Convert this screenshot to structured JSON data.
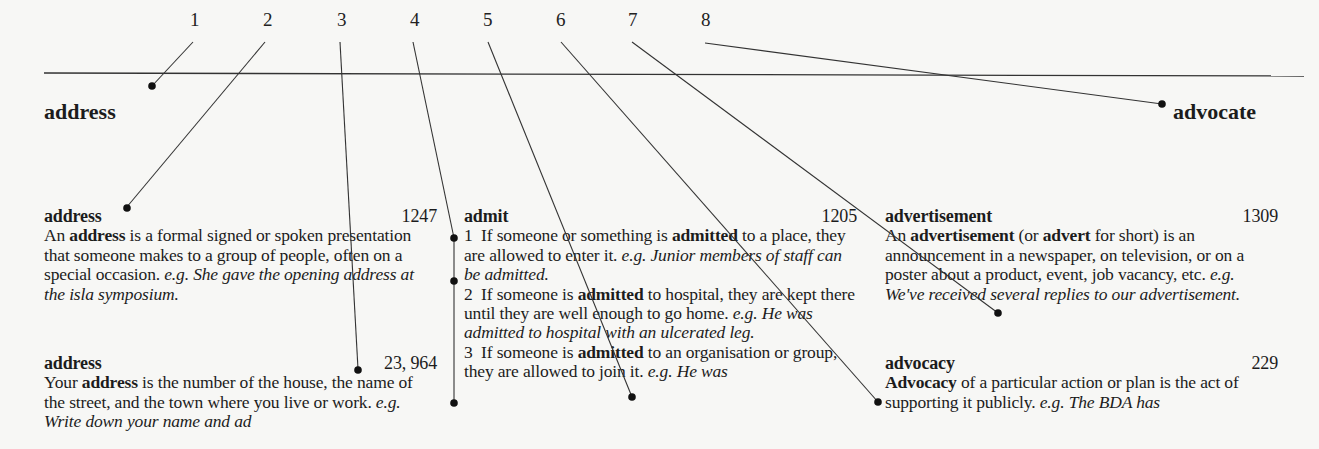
{
  "callout_numbers": [
    "1",
    "2",
    "3",
    "4",
    "5",
    "6",
    "7",
    "8"
  ],
  "running_heads": {
    "left": "address",
    "right": "advocate"
  },
  "columns": [
    {
      "entries": [
        {
          "headword": "address",
          "frequency": "1247",
          "def_pre": "An ",
          "def_bold": "address",
          "def_post": " is a formal signed or spoken presentation that someone makes to a group of people, often on a special occasion. ",
          "eg": "e.g.",
          "example": "She gave the opening address at the isla symposium."
        },
        {
          "headword": "address",
          "frequency": "23, 964",
          "def_pre": "Your ",
          "def_bold": "address",
          "def_post": " is the number of the house, the name of the street, and the town where you live or work. ",
          "eg": "e.g.",
          "example": "Write down your name and ad"
        }
      ]
    },
    {
      "entries": [
        {
          "headword": "admit",
          "frequency": "1205",
          "senses": [
            {
              "n": "1",
              "pre": "If someone or something is ",
              "bold": "admitted",
              "post": " to a place, they are allowed to enter it. ",
              "eg": "e.g.",
              "example": "Junior members of staff can be admitted."
            },
            {
              "n": "2",
              "pre": "If someone is ",
              "bold": "admitted",
              "post": " to hospital, they are kept there until they are well enough to go home. ",
              "eg": "e.g.",
              "example": "He was admitted to hospital with an ulcerated leg."
            },
            {
              "n": "3",
              "pre": "If someone is ",
              "bold": "admitted",
              "post": " to an organisation or group, they are allowed to join it. ",
              "eg": "e.g.",
              "example": "He was"
            }
          ]
        }
      ]
    },
    {
      "entries": [
        {
          "headword": "advertisement",
          "frequency": "1309",
          "def_pre": "An ",
          "def_bold": "advertisement",
          "def_mid": " (or ",
          "def_bold2": "advert",
          "def_post": " for short) is an announcement in a newspaper, on television, or on a poster about a product, event, job vacancy, etc. ",
          "eg": "e.g.",
          "example": "We've received several replies to our advertisement."
        },
        {
          "headword": "advocacy",
          "frequency": "229",
          "def_bold": "Advocacy",
          "def_post": " of a particular action or plan is the act of supporting it publicly. ",
          "eg": "e.g.",
          "example": "The BDA has"
        }
      ]
    }
  ],
  "colors": {
    "ink": "#1c1c1c",
    "paper": "#f7f7f5",
    "rule": "#333333"
  }
}
